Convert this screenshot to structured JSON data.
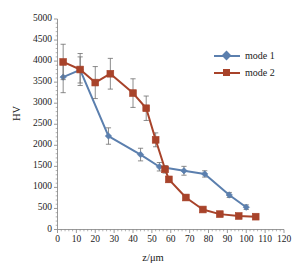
{
  "chart_data": {
    "type": "line",
    "title": "",
    "xlabel": "z/μm",
    "ylabel": "HV",
    "xlim": [
      0,
      120
    ],
    "ylim": [
      0,
      5000
    ],
    "xticks": [
      0,
      10,
      20,
      30,
      40,
      50,
      60,
      70,
      80,
      90,
      100,
      110,
      120
    ],
    "yticks": [
      0,
      500,
      1000,
      1500,
      2000,
      2500,
      3000,
      3500,
      4000,
      4500,
      5000
    ],
    "xtick_labels": [
      "0",
      "10",
      "20",
      "30",
      "40",
      "50",
      "60",
      "70",
      "80",
      "90",
      "100",
      "110",
      "120"
    ],
    "ytick_labels": [
      "0",
      "500",
      "1000",
      "1500",
      "2000",
      "2500",
      "3000",
      "3500",
      "4000",
      "4500",
      "5000"
    ],
    "grid": false,
    "legend_position": "upper right",
    "error_bars": true,
    "series": [
      {
        "name": "mode 1",
        "color": "#5b7fae",
        "marker": "diamond",
        "x": [
          3,
          12,
          27,
          44,
          54,
          67,
          78,
          91,
          100
        ],
        "y": [
          3620,
          3790,
          2220,
          1780,
          1490,
          1395,
          1320,
          820,
          530
        ],
        "yerr": [
          370,
          310,
          195,
          150,
          100,
          105,
          75,
          60,
          55
        ]
      },
      {
        "name": "mode 2",
        "color": "#a8432a",
        "marker": "square",
        "x": [
          3,
          12,
          20,
          28,
          40,
          47,
          52,
          57,
          59,
          68,
          77,
          86,
          96,
          105
        ],
        "y": [
          3980,
          3800,
          3490,
          3700,
          3240,
          2880,
          2130,
          1430,
          1190,
          760,
          475,
          365,
          320,
          305
        ],
        "yerr": [
          420,
          380,
          380,
          365,
          340,
          290,
          165,
          90,
          70,
          60,
          45,
          35,
          30,
          25
        ]
      }
    ],
    "colors": {
      "mode1": "#5b7fae",
      "mode2": "#a8432a",
      "axis": "#808080",
      "background": "#ffffff",
      "text": "#1a1a1a"
    }
  },
  "legend": {
    "items": [
      {
        "label": "mode 1"
      },
      {
        "label": "mode 2"
      }
    ]
  }
}
